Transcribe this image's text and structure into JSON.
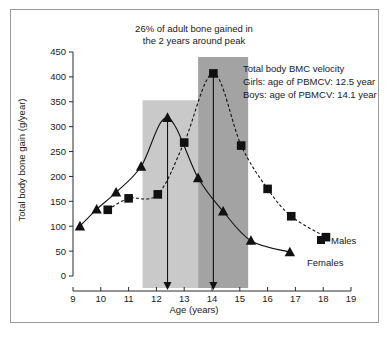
{
  "figure": {
    "title_line1": "26% of adult bone gained in",
    "title_line2": "the 2 years around peak",
    "annotation_line1": "Total body BMC velocity",
    "annotation_line2": "Girls: age of PBMCV: 12.5 year",
    "annotation_line3": "Boys: age of PBMCV: 14.1 year",
    "males_label": "Males",
    "females_label": "Females",
    "colors": {
      "band_light": "#c9c9c9",
      "band_dark": "#a3a3a3",
      "ink": "#111111",
      "border": "#9a9a9a",
      "background": "#ffffff"
    }
  },
  "chart_data": {
    "type": "line",
    "title": "26% of adult bone gained in the 2 years around peak",
    "xlabel": "Age (years)",
    "ylabel": "Total body bone gain (g/year)",
    "xlim": [
      9,
      19
    ],
    "ylim": [
      0,
      450
    ],
    "xticks": [
      9,
      10,
      11,
      12,
      13,
      14,
      15,
      16,
      17,
      18,
      19
    ],
    "yticks": [
      0,
      50,
      100,
      150,
      200,
      250,
      300,
      350,
      400,
      450
    ],
    "grid": false,
    "legend_position": "right-inline",
    "series": [
      {
        "name": "Females",
        "marker": "triangle",
        "line_style": "solid",
        "x": [
          9.25,
          9.85,
          10.55,
          11.45,
          12.4,
          13.5,
          14.4,
          15.4,
          16.8
        ],
        "y": [
          100,
          134,
          168,
          220,
          318,
          197,
          130,
          71,
          48
        ]
      },
      {
        "name": "Males",
        "marker": "square",
        "line_style": "dashed",
        "x": [
          10.25,
          11.0,
          12.05,
          13.0,
          14.05,
          15.05,
          16.0,
          16.85,
          18.1
        ],
        "y": [
          133,
          156,
          164,
          268,
          407,
          262,
          175,
          120,
          78
        ]
      }
    ],
    "bands": [
      {
        "name": "girls-peak-band",
        "x_start": 11.5,
        "x_end": 13.5,
        "y_top": 353,
        "shade": "light"
      },
      {
        "name": "boys-peak-band",
        "x_start": 13.5,
        "x_end": 15.3,
        "y_top": 440,
        "shade": "dark"
      }
    ],
    "annotations": [
      {
        "name": "girls-pbmcv-arrow",
        "x": 12.4,
        "y_from": 318,
        "y_to": 0
      },
      {
        "name": "boys-pbmcv-arrow",
        "x": 14.05,
        "y_from": 407,
        "y_to": 0
      }
    ]
  }
}
